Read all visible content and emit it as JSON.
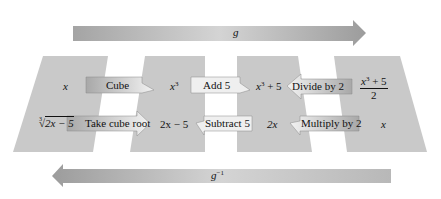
{
  "forward_arrow": {
    "label": "g",
    "direction": "right"
  },
  "inverse_arrow": {
    "label_base": "g",
    "label_sup": "−1",
    "direction": "left"
  },
  "panels": [
    {
      "top_expr": "x",
      "bottom_expr_radical_index": "3",
      "bottom_expr_radicand": "2x − 5"
    },
    {
      "top_expr_base": "x",
      "top_expr_sup": "3",
      "bottom_expr": "2x − 5"
    },
    {
      "top_expr_base": "x",
      "top_expr_sup": "3",
      "top_expr_rest": " + 5",
      "bottom_expr": "2x"
    },
    {
      "top_expr_num_base": "x",
      "top_expr_num_sup": "3",
      "top_expr_num_rest": " + 5",
      "top_expr_den": "2",
      "bottom_expr": "x"
    }
  ],
  "forward_steps": [
    "Cube",
    "Add 5",
    "Divide by 2"
  ],
  "inverse_steps": [
    "Take cube root",
    "Subtract 5",
    "Multiply by 2"
  ],
  "colors": {
    "panel": "#c8c8c8",
    "arrow_dark": "#9a9a9a",
    "arrow_light": "#d9d9d9",
    "box_fill": "#eeeeee",
    "box_dark": "#a8a8a8"
  }
}
